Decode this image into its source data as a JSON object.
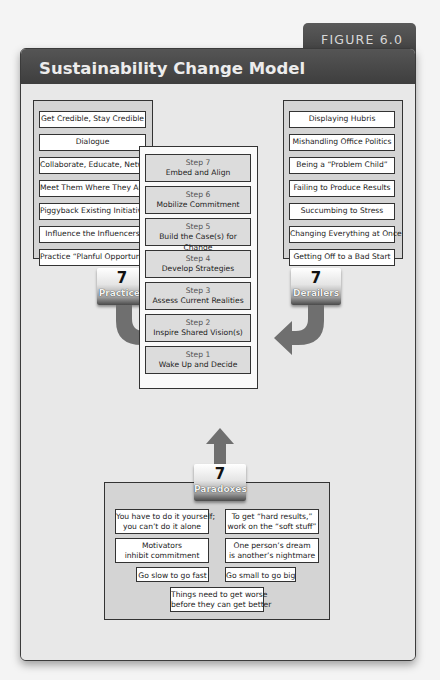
{
  "figure_label": "FIGURE 6.0",
  "title": "Sustainability Change Model",
  "colors": {
    "header_bg": "#454545",
    "panel_bg": "#d4d4d4",
    "arrow": "#6f6f6f",
    "border": "#333333"
  },
  "practices": {
    "badge_number": "7",
    "badge_label": "Practices",
    "items": [
      "Get Credible, Stay Credible",
      "Dialogue",
      "Collaborate, Educate, Network",
      "Meet Them Where They Are",
      "Piggyback Existing Initiatives",
      "Influence the Influencers",
      "Practice “Planful Opportunism”"
    ]
  },
  "derailers": {
    "badge_number": "7",
    "badge_label": "Derailers",
    "items": [
      "Displaying Hubris",
      "Mishandling Office Politics",
      "Being a “Problem Child”",
      "Failing to Produce Results",
      "Succumbing to Stress",
      "Changing Everything at Once",
      "Getting Off to a Bad Start"
    ]
  },
  "steps": [
    {
      "num": "Step 7",
      "label": "Embed and Align"
    },
    {
      "num": "Step 6",
      "label": "Mobilize Commitment"
    },
    {
      "num": "Step 5",
      "label": "Build the Case(s) for Change"
    },
    {
      "num": "Step 4",
      "label": "Develop Strategies"
    },
    {
      "num": "Step 3",
      "label": "Assess Current Realities"
    },
    {
      "num": "Step 2",
      "label": "Inspire Shared Vision(s)"
    },
    {
      "num": "Step 1",
      "label": "Wake Up and Decide"
    }
  ],
  "paradoxes": {
    "badge_number": "7",
    "badge_label": "Paradoxes",
    "items": [
      {
        "line1": "You have to do it yourself;",
        "line2": "you can’t do it alone"
      },
      {
        "line1": "To get “hard results,”",
        "line2": "work on the “soft stuff”"
      },
      {
        "line1": "Motivators",
        "line2": "inhibit commitment"
      },
      {
        "line1": "One person’s dream",
        "line2": "is another’s nightmare"
      },
      {
        "line1": "Go slow to go fast",
        "line2": ""
      },
      {
        "line1": "Go small to go big",
        "line2": ""
      },
      {
        "line1": "Things need to get worse",
        "line2": "before they can get better"
      }
    ]
  }
}
